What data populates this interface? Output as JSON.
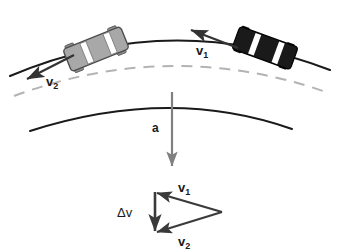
{
  "figure": {
    "background_color": "#ffffff"
  },
  "road": {
    "outer_edge": {
      "name": "outer-road-edge",
      "color": "#1a1a1a",
      "style": "solid"
    },
    "center_line": {
      "name": "road-center-line",
      "color": "#b0b0b0",
      "style": "dashed"
    },
    "inner_edge": {
      "name": "inner-road-edge",
      "color": "#1a1a1a",
      "style": "solid"
    }
  },
  "cars": [
    {
      "id": "car-rear-gray",
      "body_color": "#a8a8a8",
      "outline_color": "#4d4d4d",
      "window_color": "#ffffff",
      "rotation_deg": -22,
      "position_label": "left"
    },
    {
      "id": "car-front-dark",
      "body_color": "#1a1a1a",
      "outline_color": "#000000",
      "window_color": "#ffffff",
      "rotation_deg": 20,
      "position_label": "right"
    }
  ],
  "vectors": {
    "v1_road": {
      "label": "v",
      "subscript": "1",
      "color": "#333333",
      "description": "velocity of car at first position, tangent to curve"
    },
    "v2_road": {
      "label": "v",
      "subscript": "2",
      "color": "#333333",
      "description": "velocity of car at second position, tangent to curve"
    },
    "acceleration": {
      "label": "a",
      "color": "#808080",
      "description": "centripetal acceleration pointing toward center of curve"
    }
  },
  "vector_triangle": {
    "v1": {
      "label": "v",
      "subscript": "1",
      "color": "#3a3a3a"
    },
    "v2": {
      "label": "v",
      "subscript": "2",
      "color": "#3a3a3a"
    },
    "delta_v": {
      "label": "Δv",
      "color": "#3a3a3a"
    }
  }
}
